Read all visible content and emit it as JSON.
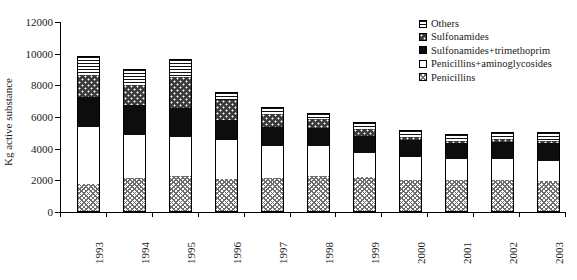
{
  "chart_data": {
    "type": "bar",
    "subtype": "stacked-bar",
    "title": "",
    "xlabel": "",
    "ylabel": "Kg active substance",
    "ylim": [
      0,
      12000
    ],
    "ytick_values": [
      0,
      2000,
      4000,
      6000,
      8000,
      10000,
      12000
    ],
    "ytick_labels": [
      "0",
      "2000",
      "4000",
      "6000",
      "8000",
      "10000",
      "12000"
    ],
    "grid": false,
    "legend_position": "top-right",
    "categories": [
      "1993",
      "1994",
      "1995",
      "1996",
      "1997",
      "1998",
      "1999",
      "2000",
      "2001",
      "2002",
      "2003"
    ],
    "series": [
      {
        "name": "Penicillins",
        "pattern": "cross-hatch-gray",
        "values": [
          1770,
          2150,
          2250,
          2100,
          2150,
          2250,
          2200,
          2050,
          2000,
          2050,
          1950
        ]
      },
      {
        "name": "Penicillins+aminoglycosides",
        "pattern": "white",
        "values": [
          3600,
          2720,
          2500,
          2450,
          2000,
          1900,
          1500,
          1450,
          1350,
          1300,
          1250
        ]
      },
      {
        "name": "Sulfonamides+trimethoprim",
        "pattern": "solid-black",
        "values": [
          1880,
          1880,
          1850,
          1250,
          1200,
          1150,
          1100,
          1050,
          1000,
          1100,
          1150
        ]
      },
      {
        "name": "Sulfonamides",
        "pattern": "dotted-dark",
        "values": [
          1400,
          1300,
          1900,
          1250,
          850,
          600,
          450,
          200,
          150,
          150,
          150
        ]
      },
      {
        "name": "Others",
        "pattern": "horizontal-lines",
        "values": [
          1200,
          1000,
          1150,
          550,
          450,
          350,
          450,
          450,
          450,
          450,
          550
        ]
      }
    ],
    "totals": [
      9850,
      9050,
      9650,
      7600,
      6650,
      6250,
      5700,
      5200,
      4950,
      5050,
      5050
    ]
  },
  "legend": {
    "items": [
      {
        "label": "Others",
        "swatch": "horizontal-lines-swatch"
      },
      {
        "label": "Sulfonamides",
        "swatch": "dotted-dark-swatch"
      },
      {
        "label": "Sulfonamides+trimethoprim",
        "swatch": "solid-black-swatch"
      },
      {
        "label": "Penicillins+aminoglycosides",
        "swatch": "white-swatch"
      },
      {
        "label": "Penicillins",
        "swatch": "cross-hatch-swatch"
      }
    ]
  },
  "colors": {
    "axis": "#000000",
    "text": "#1a1a1a",
    "background": "#ffffff",
    "solid_black": "#0d0d0d",
    "dotted_dark": "#3a3a3a",
    "hatch_gray": "#6e6e6e"
  }
}
